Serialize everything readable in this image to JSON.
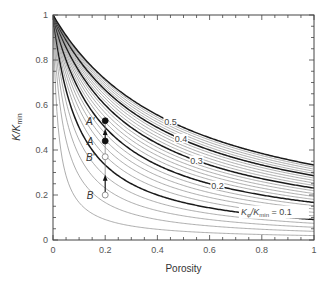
{
  "chart_data": {
    "type": "line",
    "title": "",
    "xlabel": "Porosity",
    "ylabel_main": "K/K",
    "ylabel_sub": "min",
    "xlim": [
      0,
      1
    ],
    "ylim": [
      0,
      1
    ],
    "x_ticks": [
      {
        "value": 0,
        "label": "0"
      },
      {
        "value": 0.2,
        "label": "0.2"
      },
      {
        "value": 0.4,
        "label": "0.4"
      },
      {
        "value": 0.6,
        "label": "0.6"
      },
      {
        "value": 0.8,
        "label": "0.8"
      },
      {
        "value": 1,
        "label": "1"
      }
    ],
    "y_ticks": [
      {
        "value": 0,
        "label": "0"
      },
      {
        "value": 0.2,
        "label": "0.2"
      },
      {
        "value": 0.4,
        "label": "0.4"
      },
      {
        "value": 0.6,
        "label": "0.6"
      },
      {
        "value": 0.8,
        "label": "0.8"
      },
      {
        "value": 1,
        "label": "1"
      }
    ],
    "minor_tick_step": 0.05,
    "grid": false,
    "curve_family": {
      "parameter_name": "Kφ/Kmin",
      "formula": "K/Kmin = 1 / (1 + porosity / (Kφ/Kmin))",
      "values": [
        0.02,
        0.04,
        0.06,
        0.08,
        0.1,
        0.12,
        0.14,
        0.16,
        0.18,
        0.2,
        0.22,
        0.24,
        0.26,
        0.28,
        0.3,
        0.32,
        0.34,
        0.36,
        0.38,
        0.4,
        0.42,
        0.44,
        0.46,
        0.48,
        0.5
      ],
      "thick_values": [
        0.1,
        0.2,
        0.3,
        0.4,
        0.5
      ]
    },
    "curve_labels": [
      {
        "value": 0.5,
        "text": "0.5",
        "porosity": 0.45
      },
      {
        "value": 0.4,
        "text": "0.4",
        "porosity": 0.49
      },
      {
        "value": 0.3,
        "text": "0.3",
        "porosity": 0.55
      },
      {
        "value": 0.2,
        "text": "0.2",
        "porosity": 0.63
      },
      {
        "value": 0.1,
        "text_main": "K",
        "text_sub1": "φ",
        "text_mid": "/K",
        "text_sub2": "min",
        "text_tail": " = 0.1",
        "porosity": 0.72
      }
    ],
    "points": [
      {
        "name": "A'",
        "porosity": 0.2,
        "value": 0.53,
        "filled": true
      },
      {
        "name": "A",
        "porosity": 0.2,
        "value": 0.44,
        "filled": true
      },
      {
        "name": "B'",
        "porosity": 0.2,
        "value": 0.37,
        "filled": false
      },
      {
        "name": "B",
        "porosity": 0.2,
        "value": 0.2,
        "filled": false
      }
    ],
    "arrows": [
      {
        "from": "A",
        "to": "A'"
      },
      {
        "from": "B",
        "to": "B'"
      }
    ],
    "colors": {
      "thin": "#8a8a8a",
      "thick": "#1a1a1a",
      "axis": "#444444"
    }
  }
}
